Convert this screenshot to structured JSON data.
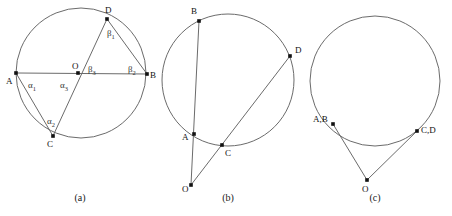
{
  "figure": {
    "background_color": "#ffffff",
    "stroke_color": "#6b6b6b",
    "dot_color": "#111111",
    "width": 452,
    "height": 216
  },
  "panels": [
    {
      "id": "a",
      "caption": "(a)",
      "caption_pos": {
        "x": 80,
        "y": 201
      },
      "description": "Circle with center O, diameter A-B, chord C-D through O, chords A-C and D-B; interior angles alpha1, alpha2, alpha3, beta1, beta2, beta3 marked",
      "circle": {
        "cx": 81,
        "cy": 73,
        "r": 65
      },
      "points": [
        {
          "name": "A",
          "x": 16,
          "y": 73,
          "label": "A",
          "label_x": 6,
          "label_y": 84
        },
        {
          "name": "B",
          "x": 147,
          "y": 74,
          "label": "B",
          "label_x": 150,
          "label_y": 78
        },
        {
          "name": "C",
          "x": 53,
          "y": 136,
          "label": "C",
          "label_x": 47,
          "label_y": 147
        },
        {
          "name": "D",
          "x": 107,
          "y": 19,
          "label": "D",
          "label_x": 105,
          "label_y": 13
        },
        {
          "name": "O",
          "x": 78,
          "y": 73,
          "label": "O",
          "label_x": 72,
          "label_y": 69
        }
      ],
      "segments": [
        {
          "from": "A",
          "to": "B",
          "name": "diameter-ab"
        },
        {
          "from": "C",
          "to": "D",
          "name": "chord-cd"
        },
        {
          "from": "A",
          "to": "C",
          "name": "chord-ac"
        },
        {
          "from": "D",
          "to": "B",
          "name": "chord-db"
        }
      ],
      "angles": [
        {
          "name": "alpha-1",
          "glyph": "α",
          "sub": "1",
          "x": 28,
          "y": 88
        },
        {
          "name": "alpha-2",
          "glyph": "α",
          "sub": "2",
          "x": 47,
          "y": 124
        },
        {
          "name": "alpha-3",
          "glyph": "α",
          "sub": "3",
          "x": 60,
          "y": 88
        },
        {
          "name": "beta-1",
          "glyph": "β",
          "sub": "1",
          "x": 107,
          "y": 36
        },
        {
          "name": "beta-2",
          "glyph": "β",
          "sub": "2",
          "x": 128,
          "y": 72
        },
        {
          "name": "beta-3",
          "glyph": "β",
          "sub": "3",
          "x": 88,
          "y": 72
        }
      ]
    },
    {
      "id": "b",
      "caption": "(b)",
      "caption_pos": {
        "x": 228,
        "y": 201
      },
      "description": "Circle with external point O and two secants: O through A to B, and O through C to D",
      "circle": {
        "cx": 228,
        "cy": 80,
        "r": 66
      },
      "points": [
        {
          "name": "B",
          "x": 199,
          "y": 21,
          "label": "B",
          "label_x": 191,
          "label_y": 14
        },
        {
          "name": "D",
          "x": 290,
          "y": 56,
          "label": "D",
          "label_x": 295,
          "label_y": 53
        },
        {
          "name": "A",
          "x": 194,
          "y": 134,
          "label": "A",
          "label_x": 182,
          "label_y": 140
        },
        {
          "name": "C",
          "x": 222,
          "y": 145,
          "label": "C",
          "label_x": 225,
          "label_y": 156
        },
        {
          "name": "O",
          "x": 191,
          "y": 185,
          "label": "O",
          "label_x": 182,
          "label_y": 192
        }
      ],
      "segments": [
        {
          "from": "O",
          "to": "B",
          "name": "secant-oab"
        },
        {
          "from": "O",
          "to": "D",
          "name": "secant-ocd"
        }
      ],
      "angles": []
    },
    {
      "id": "c",
      "caption": "(c)",
      "caption_pos": {
        "x": 375,
        "y": 201
      },
      "description": "Circle with external point O and two tangent lines touching at coincident points A,B and C,D",
      "circle": {
        "cx": 375,
        "cy": 81,
        "r": 65
      },
      "points": [
        {
          "name": "AB",
          "x": 333,
          "y": 124,
          "label": "A,B",
          "label_x": 313,
          "label_y": 122
        },
        {
          "name": "CD",
          "x": 417,
          "y": 131,
          "label": "C,D",
          "label_x": 421,
          "label_y": 133
        },
        {
          "name": "O",
          "x": 367,
          "y": 180,
          "label": "O",
          "label_x": 362,
          "label_y": 192
        }
      ],
      "segments": [
        {
          "from": "O",
          "to": "AB",
          "name": "tangent-oab"
        },
        {
          "from": "O",
          "to": "CD",
          "name": "tangent-ocd"
        }
      ],
      "angles": []
    }
  ]
}
